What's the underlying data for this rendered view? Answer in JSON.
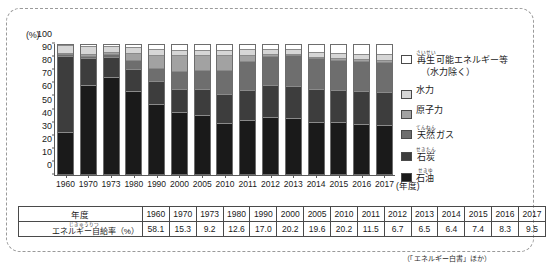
{
  "chart_data": {
    "type": "bar",
    "stacked": true,
    "title": "",
    "subtitle": "",
    "xlabel": "(年度)",
    "ylabel": "(%)",
    "ylim": [
      0,
      100
    ],
    "yticks": [
      0,
      10,
      20,
      30,
      40,
      50,
      60,
      70,
      80,
      90,
      100
    ],
    "grid": false,
    "legend_position": "right",
    "categories": [
      "1960",
      "1970",
      "1973",
      "1980",
      "1990",
      "2000",
      "2005",
      "2010",
      "2011",
      "2012",
      "2013",
      "2014",
      "2015",
      "2016",
      "2017"
    ],
    "series": [
      {
        "name": "石油",
        "color": "#1a1a1a",
        "values": [
          33.2,
          70.8,
          77.4,
          66.1,
          56.0,
          49.2,
          47.0,
          40.3,
          43.1,
          45.2,
          44.5,
          41.2,
          41.0,
          39.7,
          39.0
        ]
      },
      {
        "name": "石炭",
        "color": "#3d3d3d",
        "values": [
          60.0,
          21.0,
          15.5,
          17.1,
          17.3,
          18.1,
          20.3,
          22.7,
          23.4,
          24.6,
          25.1,
          25.5,
          25.3,
          25.4,
          25.1
        ]
      },
      {
        "name": "天然ガス",
        "color": "#6e6e6e",
        "values": [
          0.9,
          1.2,
          1.5,
          6.1,
          10.1,
          13.1,
          14.2,
          18.2,
          22.3,
          23.0,
          23.7,
          24.3,
          23.4,
          23.8,
          23.4
        ]
      },
      {
        "name": "原子力",
        "color": "#a2a2a2",
        "values": [
          0.0,
          0.3,
          0.6,
          4.7,
          9.4,
          12.4,
          11.3,
          11.2,
          4.3,
          0.6,
          0.4,
          0.0,
          0.4,
          0.8,
          1.4
        ]
      },
      {
        "name": "水力",
        "color": "#d6d6d6",
        "values": [
          5.9,
          5.6,
          4.1,
          4.3,
          4.2,
          3.4,
          3.3,
          3.3,
          3.5,
          3.3,
          3.2,
          3.3,
          3.4,
          3.4,
          3.5
        ]
      },
      {
        "name": "再生可能エネルギー等（水力除く）",
        "color": "#ffffff",
        "values": [
          0.0,
          1.1,
          0.9,
          1.7,
          3.0,
          3.8,
          3.9,
          4.3,
          3.4,
          3.3,
          3.1,
          5.7,
          6.5,
          6.9,
          7.6
        ]
      }
    ]
  },
  "legend": {
    "items": [
      {
        "label_ruby": "さいせい",
        "label_base": "再生",
        "label_rest": "可能エネルギー等",
        "sub": "（水力除く）",
        "color": "#ffffff",
        "name": "renewable-excl-hydro"
      },
      {
        "label_ruby": "",
        "label_base": "",
        "label_rest": "水力",
        "sub": "",
        "color": "#d6d6d6",
        "name": "hydro"
      },
      {
        "label_ruby": "",
        "label_base": "",
        "label_rest": "原子力",
        "sub": "",
        "color": "#a2a2a2",
        "name": "nuclear"
      },
      {
        "label_ruby": "てんねん",
        "label_base": "天然",
        "label_rest": "ガス",
        "sub": "",
        "color": "#6e6e6e",
        "name": "natural-gas"
      },
      {
        "label_ruby": "せきたん",
        "label_base": "石炭",
        "label_rest": "",
        "sub": "",
        "color": "#3d3d3d",
        "name": "coal"
      },
      {
        "label_ruby": "せきゆ",
        "label_base": "石油",
        "label_rest": "",
        "sub": "",
        "color": "#1a1a1a",
        "name": "oil"
      }
    ]
  },
  "table": {
    "row_year_header": "年度",
    "row_rate_header_ruby": "じきゅうりつ",
    "row_rate_header_base": "エネルギー自給率",
    "row_rate_header_unit": "（%）",
    "years": [
      "1960",
      "1970",
      "1973",
      "1980",
      "1990",
      "2000",
      "2005",
      "2010",
      "2011",
      "2012",
      "2013",
      "2014",
      "2015",
      "2016",
      "2017"
    ],
    "rates": [
      "58.1",
      "15.3",
      "9.2",
      "12.6",
      "17.0",
      "20.2",
      "19.6",
      "20.2",
      "11.5",
      "6.7",
      "6.5",
      "6.4",
      "7.4",
      "8.3",
      "9.5"
    ]
  },
  "footnote": "（「エネルギー白書」ほか）"
}
